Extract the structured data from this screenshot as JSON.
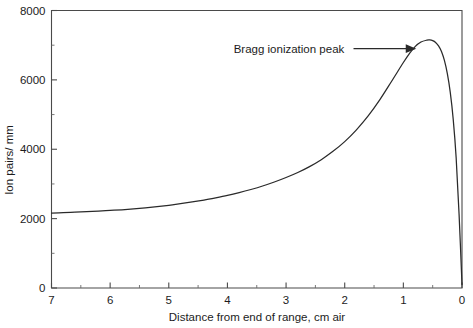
{
  "chart_data": {
    "type": "line",
    "title": "",
    "xlabel": "Distance from end of range, cm air",
    "ylabel": "Ion pairs/ mm",
    "xlim": [
      7,
      0
    ],
    "ylim": [
      0,
      8000
    ],
    "x_reversed": true,
    "grid": false,
    "legend": null,
    "x_ticks": [
      7,
      6,
      5,
      4,
      3,
      2,
      1,
      0
    ],
    "x_tick_labels": [
      "7",
      "6",
      "5",
      "4",
      "3",
      "2",
      "1",
      "0"
    ],
    "x_minor_ticks": [
      6.5,
      5.5,
      4.5,
      3.5,
      2.5,
      1.5,
      0.5
    ],
    "y_ticks": [
      0,
      2000,
      4000,
      6000,
      8000
    ],
    "y_tick_labels": [
      "0",
      "2000",
      "4000",
      "6000",
      "8000"
    ],
    "y_minor_ticks": [
      1000,
      3000,
      5000,
      7000
    ],
    "series": [
      {
        "name": "Bragg curve",
        "color": "#2a2a2a",
        "x": [
          7.0,
          6.8,
          6.6,
          6.4,
          6.2,
          6.0,
          5.8,
          5.6,
          5.4,
          5.2,
          5.0,
          4.8,
          4.6,
          4.4,
          4.2,
          4.0,
          3.8,
          3.6,
          3.4,
          3.2,
          3.0,
          2.8,
          2.6,
          2.4,
          2.2,
          2.0,
          1.8,
          1.6,
          1.4,
          1.2,
          1.0,
          0.9,
          0.8,
          0.7,
          0.6,
          0.55,
          0.5,
          0.45,
          0.4,
          0.35,
          0.3,
          0.25,
          0.2,
          0.15,
          0.1,
          0.05,
          0.0
        ],
        "y": [
          2160,
          2170,
          2185,
          2200,
          2215,
          2235,
          2255,
          2280,
          2310,
          2345,
          2385,
          2430,
          2480,
          2535,
          2600,
          2670,
          2750,
          2840,
          2940,
          3055,
          3185,
          3330,
          3500,
          3700,
          3940,
          4220,
          4560,
          4960,
          5430,
          5960,
          6500,
          6750,
          6960,
          7090,
          7145,
          7150,
          7130,
          7080,
          6980,
          6820,
          6560,
          6180,
          5640,
          4870,
          3760,
          2130,
          100
        ]
      }
    ],
    "annotations": [
      {
        "text": "Bragg ionization peak",
        "arrow": true,
        "label_x": 2.95,
        "label_y": 6900,
        "arrow_from_x": 1.85,
        "arrow_to_x": 0.78,
        "arrow_y": 6900
      }
    ],
    "peak": {
      "x": 0.55,
      "y": 7150,
      "label": "Bragg ionization peak"
    }
  },
  "axes": {
    "y_axis_label": "Ion pairs/ mm",
    "x_axis_label": "Distance from end of range, cm air"
  },
  "colors": {
    "background": "#ffffff",
    "curve": "#2a2a2a",
    "frame": "#4a4a4a",
    "text": "#1c1c1c"
  }
}
